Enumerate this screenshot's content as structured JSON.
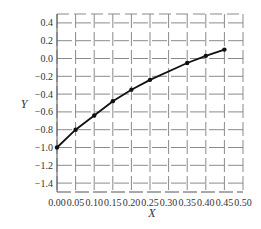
{
  "chart_data": {
    "type": "line",
    "title": "",
    "xlabel": "X",
    "ylabel": "Y",
    "xlim": [
      0.0,
      0.5
    ],
    "ylim": [
      -1.5,
      0.5
    ],
    "grid": true,
    "legend": null,
    "x_ticks": [
      "0.00",
      "0.05",
      "0.10",
      "0.15",
      "0.20",
      "0.25",
      "0.30",
      "0.35",
      "0.40",
      "0.45",
      "0.50"
    ],
    "y_ticks": [
      "0.4",
      "0.2",
      "0.0",
      "−0.2",
      "−0.4",
      "−0.6",
      "−0.8",
      "−1.0",
      "−1.2",
      "−1.4"
    ],
    "series": [
      {
        "name": "Y",
        "marker": "circle",
        "color": "#111111",
        "x": [
          0.0,
          0.05,
          0.1,
          0.15,
          0.2,
          0.25,
          0.35,
          0.4,
          0.45
        ],
        "y": [
          -1.0,
          -0.8,
          -0.64,
          -0.48,
          -0.35,
          -0.24,
          -0.05,
          0.03,
          0.1
        ]
      }
    ]
  }
}
